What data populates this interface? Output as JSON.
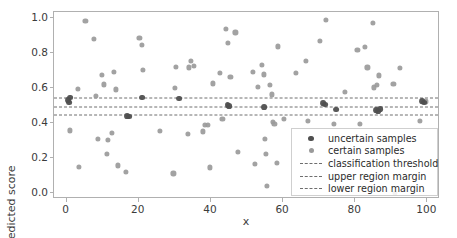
{
  "chart_data": {
    "type": "scatter",
    "title": "",
    "xlabel": "x",
    "ylabel": "predicted score",
    "xlim": [
      -3.5,
      103.5
    ],
    "ylim": [
      -0.035,
      1.035
    ],
    "xticks": [
      0,
      20,
      40,
      60,
      80,
      100
    ],
    "yticks": [
      "0.0",
      "0.2",
      "0.4",
      "0.6",
      "0.8",
      "1.0"
    ],
    "grid": false,
    "legend_position": "lower right",
    "colors": {
      "uncertain": "#4f4f4f",
      "certain": "#9a9a9a",
      "threshold_line": "#6e6e6e",
      "axes": "#b0b0b0",
      "text": "#3b3b3b"
    },
    "hlines": [
      {
        "name": "upper region margin",
        "y": 0.545
      },
      {
        "name": "classification threshold",
        "y": 0.492
      },
      {
        "name": "lower region margin",
        "y": 0.444
      }
    ],
    "series": [
      {
        "name": "uncertain samples",
        "marker": "o",
        "color": "#4f4f4f",
        "points": [
          [
            0.4,
            0.532
          ],
          [
            0.7,
            0.517
          ],
          [
            1.0,
            0.545
          ],
          [
            16.8,
            0.441
          ],
          [
            17.4,
            0.437
          ],
          [
            21.0,
            0.545
          ],
          [
            31.2,
            0.539
          ],
          [
            44.6,
            0.504
          ],
          [
            45.0,
            0.496
          ],
          [
            54.8,
            0.492
          ],
          [
            71.2,
            0.515
          ],
          [
            71.6,
            0.505
          ],
          [
            74.6,
            0.477
          ],
          [
            85.8,
            0.474
          ],
          [
            86.4,
            0.47
          ],
          [
            87.0,
            0.478
          ],
          [
            98.6,
            0.524
          ],
          [
            99.2,
            0.517
          ]
        ]
      },
      {
        "name": "certain samples",
        "marker": "o",
        "color": "#9a9a9a",
        "points": [
          [
            0.8,
            0.357
          ],
          [
            3.2,
            0.594
          ],
          [
            3.4,
            0.149
          ],
          [
            5.2,
            0.983
          ],
          [
            7.6,
            0.88
          ],
          [
            8.2,
            0.556
          ],
          [
            8.6,
            0.308
          ],
          [
            9.8,
            0.676
          ],
          [
            10.4,
            0.621
          ],
          [
            11.2,
            0.223
          ],
          [
            11.4,
            0.303
          ],
          [
            12.6,
            0.341
          ],
          [
            13.2,
            0.69
          ],
          [
            13.6,
            0.592
          ],
          [
            14.2,
            0.157
          ],
          [
            16.4,
            0.118
          ],
          [
            20.2,
            0.889
          ],
          [
            20.8,
            0.845
          ],
          [
            21.2,
            0.702
          ],
          [
            25.8,
            0.355
          ],
          [
            29.6,
            0.111
          ],
          [
            30.0,
            0.599
          ],
          [
            30.4,
            0.721
          ],
          [
            33.6,
            0.336
          ],
          [
            33.8,
            0.718
          ],
          [
            34.4,
            0.757
          ],
          [
            35.2,
            0.726
          ],
          [
            37.8,
            0.352
          ],
          [
            38.4,
            0.39
          ],
          [
            39.2,
            0.387
          ],
          [
            39.8,
            0.146
          ],
          [
            40.6,
            0.626
          ],
          [
            42.6,
            0.688
          ],
          [
            43.2,
            0.421
          ],
          [
            44.2,
            0.937
          ],
          [
            44.8,
            0.86
          ],
          [
            45.4,
            0.665
          ],
          [
            46.8,
            0.918
          ],
          [
            47.4,
            0.233
          ],
          [
            51.6,
            0.692
          ],
          [
            52.2,
            0.167
          ],
          [
            53.0,
            0.606
          ],
          [
            54.2,
            0.732
          ],
          [
            54.6,
            0.678
          ],
          [
            55.0,
            0.311
          ],
          [
            55.2,
            0.221
          ],
          [
            55.6,
            0.039
          ],
          [
            56.4,
            0.62
          ],
          [
            56.8,
            0.563
          ],
          [
            57.2,
            0.404
          ],
          [
            57.6,
            0.393
          ],
          [
            58.2,
            0.173
          ],
          [
            58.6,
            0.838
          ],
          [
            60.2,
            0.424
          ],
          [
            63.6,
            0.687
          ],
          [
            66.4,
            0.756
          ],
          [
            66.8,
            0.41
          ],
          [
            70.2,
            0.869
          ],
          [
            71.8,
            0.989
          ],
          [
            74.0,
            0.395
          ],
          [
            77.2,
            0.58
          ],
          [
            80.6,
            0.819
          ],
          [
            81.4,
            0.394
          ],
          [
            82.6,
            0.834
          ],
          [
            83.4,
            0.718
          ],
          [
            84.8,
            0.974
          ],
          [
            85.2,
            0.604
          ],
          [
            86.0,
            0.619
          ],
          [
            86.6,
            0.672
          ],
          [
            90.6,
            0.622
          ],
          [
            91.0,
            0.001
          ],
          [
            92.4,
            0.713
          ],
          [
            98.0,
            0.414
          ],
          [
            99.6,
            0.523
          ]
        ]
      }
    ]
  },
  "legend": {
    "entries": [
      {
        "label": "uncertain samples",
        "key": "dot-dark"
      },
      {
        "label": "certain samples",
        "key": "dot-light"
      },
      {
        "label": "classification threshold",
        "key": "dash"
      },
      {
        "label": "upper region margin",
        "key": "dash"
      },
      {
        "label": "lower region margin",
        "key": "dash"
      }
    ]
  }
}
